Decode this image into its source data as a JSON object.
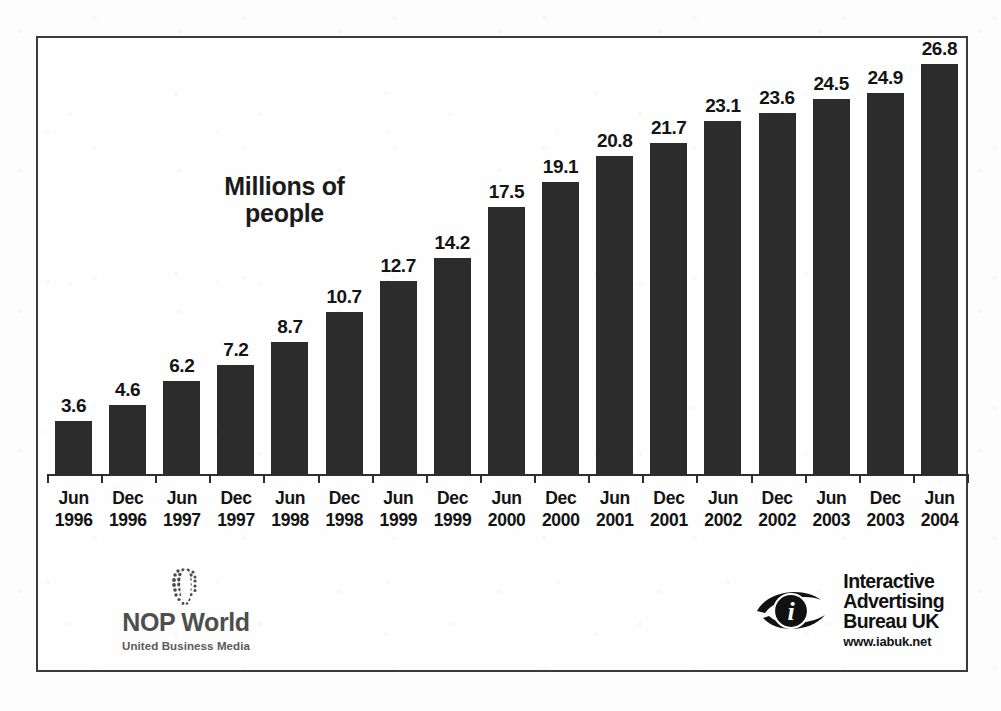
{
  "chart_data": {
    "type": "bar",
    "title": "Millions of people",
    "xlabel": "",
    "ylabel": "Millions of people",
    "ylim": [
      0,
      28.5
    ],
    "grid": false,
    "legend": null,
    "categories": [
      "Jun 1996",
      "Dec 1996",
      "Jun 1997",
      "Dec 1997",
      "Jun 1998",
      "Dec 1998",
      "Jun 1999",
      "Dec 1999",
      "Jun 2000",
      "Dec 2000",
      "Jun 2001",
      "Dec 2001",
      "Jun 2002",
      "Dec 2002",
      "Jun 2003",
      "Dec 2003",
      "Jun 2004"
    ],
    "tick_months": [
      "Jun",
      "Dec",
      "Jun",
      "Dec",
      "Jun",
      "Dec",
      "Jun",
      "Dec",
      "Jun",
      "Dec",
      "Jun",
      "Dec",
      "Jun",
      "Dec",
      "Jun",
      "Dec",
      "Jun"
    ],
    "tick_years": [
      "1996",
      "1996",
      "1997",
      "1997",
      "1998",
      "1998",
      "1999",
      "1999",
      "2000",
      "2000",
      "2001",
      "2001",
      "2002",
      "2002",
      "2003",
      "2003",
      "2004"
    ],
    "values": [
      3.6,
      4.6,
      6.2,
      7.2,
      8.7,
      10.7,
      12.7,
      14.2,
      17.5,
      19.1,
      20.8,
      21.7,
      23.1,
      23.6,
      24.5,
      24.9,
      26.8
    ],
    "value_labels": [
      "3.6",
      "4.6",
      "6.2",
      "7.2",
      "8.7",
      "10.7",
      "12.7",
      "14.2",
      "17.5",
      "19.1",
      "20.8",
      "21.7",
      "23.1",
      "23.6",
      "24.5",
      "24.9",
      "26.8"
    ],
    "bar_color": "#2c2c2c",
    "axis_color": "#2e2e2e",
    "background": "#fefefe"
  },
  "footer": {
    "nop": {
      "name": "NOP World",
      "tagline": "United Business Media",
      "icon": "dotted-globe-icon"
    },
    "iab": {
      "line1": "Interactive",
      "line2": "Advertising",
      "line3": "Bureau UK",
      "url": "www.iabuk.net",
      "icon": "eye-i-logo-icon"
    }
  }
}
